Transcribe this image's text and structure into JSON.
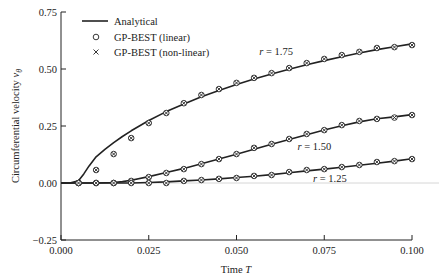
{
  "chart_data": {
    "type": "line",
    "title": "",
    "xlabel": "Time T",
    "ylabel": "Circumferential velocity v_θ",
    "xlim": [
      0.0,
      0.1
    ],
    "ylim": [
      -0.25,
      0.75
    ],
    "xticks": [
      "0.000",
      "0.025",
      "0.050",
      "0.075",
      "0.100"
    ],
    "yticks": [
      "0.75",
      "0.50",
      "0.25",
      "0.00",
      "−0.25"
    ],
    "grid": false,
    "zero_reference_line": true,
    "legend": {
      "position": "upper-left",
      "entries": [
        {
          "label": "Analytical",
          "style": "solid-line"
        },
        {
          "label": "GP-BEST (linear)",
          "style": "circle-marker"
        },
        {
          "label": "GP-BEST (non-linear)",
          "style": "x-marker"
        }
      ]
    },
    "annotations": [
      {
        "text": "r = 1.75",
        "x": 0.0565,
        "y": 0.56
      },
      {
        "text": "r = 1.50",
        "x": 0.0674,
        "y": 0.145
      },
      {
        "text": "r = 1.25",
        "x": 0.0718,
        "y": 0.005
      }
    ],
    "series": [
      {
        "name": "Analytical r = 1.75",
        "kind": "line",
        "x": [
          0.0,
          0.0025,
          0.005,
          0.0065,
          0.008,
          0.01,
          0.0125,
          0.015,
          0.0175,
          0.02,
          0.025,
          0.03,
          0.035,
          0.04,
          0.045,
          0.05,
          0.055,
          0.06,
          0.065,
          0.07,
          0.075,
          0.08,
          0.085,
          0.09,
          0.095,
          0.1
        ],
        "y": [
          0.0,
          0.0,
          0.01,
          0.04,
          0.075,
          0.115,
          0.148,
          0.177,
          0.204,
          0.229,
          0.274,
          0.313,
          0.347,
          0.378,
          0.406,
          0.432,
          0.456,
          0.478,
          0.499,
          0.519,
          0.537,
          0.554,
          0.57,
          0.585,
          0.598,
          0.61
        ]
      },
      {
        "name": "GP-BEST r = 1.75",
        "kind": "markers",
        "x": [
          0.005,
          0.01,
          0.015,
          0.02,
          0.025,
          0.03,
          0.035,
          0.04,
          0.045,
          0.05,
          0.055,
          0.06,
          0.065,
          0.07,
          0.075,
          0.08,
          0.085,
          0.09,
          0.095,
          0.1
        ],
        "y": [
          0.0,
          0.057,
          0.127,
          0.197,
          0.263,
          0.307,
          0.35,
          0.386,
          0.412,
          0.439,
          0.461,
          0.482,
          0.504,
          0.526,
          0.544,
          0.561,
          0.575,
          0.592,
          0.596,
          0.605
        ]
      },
      {
        "name": "Analytical r = 1.50",
        "kind": "line",
        "x": [
          0.0,
          0.01,
          0.015,
          0.0175,
          0.02,
          0.025,
          0.03,
          0.035,
          0.04,
          0.045,
          0.05,
          0.055,
          0.06,
          0.065,
          0.07,
          0.075,
          0.08,
          0.085,
          0.09,
          0.095,
          0.1
        ],
        "y": [
          0.0,
          0.0,
          0.002,
          0.006,
          0.012,
          0.028,
          0.046,
          0.064,
          0.084,
          0.105,
          0.126,
          0.148,
          0.17,
          0.191,
          0.212,
          0.232,
          0.251,
          0.268,
          0.282,
          0.29,
          0.3
        ]
      },
      {
        "name": "GP-BEST r = 1.50",
        "kind": "markers",
        "x": [
          0.005,
          0.01,
          0.015,
          0.02,
          0.025,
          0.03,
          0.035,
          0.04,
          0.045,
          0.05,
          0.055,
          0.06,
          0.065,
          0.07,
          0.075,
          0.08,
          0.085,
          0.09,
          0.095,
          0.1
        ],
        "y": [
          0.0,
          0.0,
          0.0,
          0.009,
          0.026,
          0.044,
          0.061,
          0.083,
          0.105,
          0.127,
          0.154,
          0.171,
          0.193,
          0.215,
          0.232,
          0.254,
          0.272,
          0.281,
          0.287,
          0.298
        ]
      },
      {
        "name": "Analytical r = 1.25",
        "kind": "line",
        "x": [
          0.0,
          0.02,
          0.025,
          0.03,
          0.035,
          0.04,
          0.045,
          0.05,
          0.055,
          0.06,
          0.065,
          0.07,
          0.075,
          0.08,
          0.085,
          0.09,
          0.095,
          0.1
        ],
        "y": [
          0.0,
          0.0,
          0.002,
          0.005,
          0.009,
          0.013,
          0.018,
          0.024,
          0.03,
          0.037,
          0.045,
          0.053,
          0.061,
          0.069,
          0.078,
          0.087,
          0.096,
          0.106
        ]
      },
      {
        "name": "GP-BEST r = 1.25",
        "kind": "markers",
        "x": [
          0.005,
          0.01,
          0.015,
          0.02,
          0.025,
          0.03,
          0.035,
          0.04,
          0.045,
          0.05,
          0.055,
          0.06,
          0.065,
          0.07,
          0.075,
          0.08,
          0.085,
          0.09,
          0.095,
          0.1
        ],
        "y": [
          0.0,
          0.0,
          0.0,
          0.0,
          0.0,
          0.0,
          0.009,
          0.013,
          0.018,
          0.022,
          0.031,
          0.035,
          0.048,
          0.057,
          0.061,
          0.07,
          0.079,
          0.092,
          0.096,
          0.105
        ]
      }
    ]
  },
  "colors": {
    "ink": "#222222",
    "zero_line": "#cccccc",
    "background": "#ffffff"
  }
}
